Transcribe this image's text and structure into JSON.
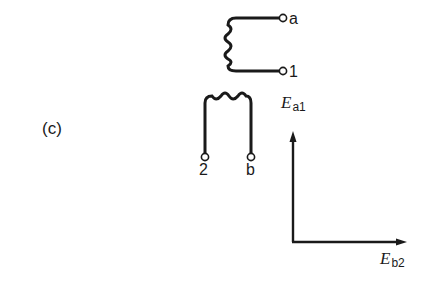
{
  "figure": {
    "panel_label": "(c)",
    "winding_top": {
      "terminal_top_label": "a",
      "terminal_bottom_label": "1"
    },
    "winding_bottom": {
      "terminal_left_label": "2",
      "terminal_right_label": "b"
    },
    "phasor": {
      "vertical_label_main": "E",
      "vertical_label_sub": "a1",
      "horizontal_label_main": "E",
      "horizontal_label_sub": "b2"
    },
    "colors": {
      "ink": "#1a1a1a",
      "background": "#ffffff"
    }
  }
}
